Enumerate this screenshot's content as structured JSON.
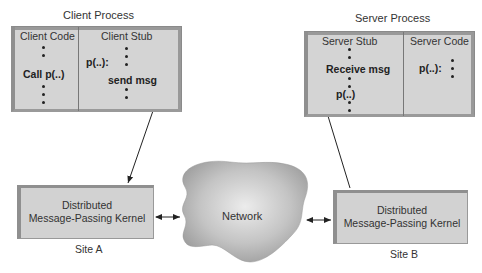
{
  "client_process": {
    "title": "Client Process",
    "left_column": {
      "header": "Client Code",
      "call_label": "Call p(..)"
    },
    "right_column": {
      "header": "Client Stub",
      "proc_label": "p(..):",
      "send_label": "send msg"
    }
  },
  "server_process": {
    "title": "Server Process",
    "left_column": {
      "header": "Server Stub",
      "receive_label": "Receive msg",
      "proc_label": "p(..)"
    },
    "right_column": {
      "header": "Server Code",
      "proc_label": "p(..):"
    }
  },
  "network": {
    "label": "Network"
  },
  "site_a": {
    "kernel_line1": "Distributed",
    "kernel_line2": "Message-Passing Kernel",
    "label": "Site A"
  },
  "site_b": {
    "kernel_line1": "Distributed",
    "kernel_line2": "Message-Passing Kernel",
    "label": "Site B"
  },
  "colors": {
    "box_fill": "#d4d4d4",
    "cloud_fill": "#b8b8b8",
    "line": "#222222"
  }
}
